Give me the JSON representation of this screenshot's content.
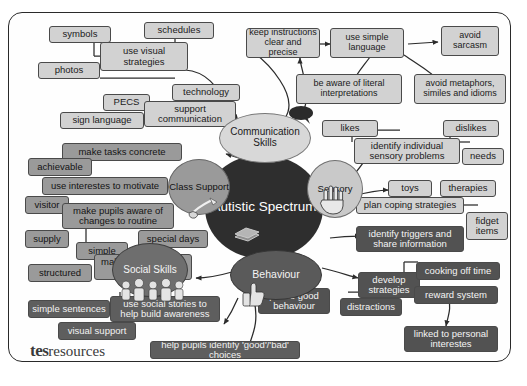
{
  "diagram": {
    "title": "Autistic Spectrum",
    "footer_logo_bold": "tes",
    "footer_logo_light": "resources",
    "colors": {
      "hub": "#2e2e2e",
      "branch_communication": "#d8d8d8",
      "branch_class_support": "#9a9a9a",
      "branch_sensory": "#c9c9c9",
      "branch_social": "#6e6e6e",
      "branch_behaviour": "#5a5a5a",
      "border": "#2a2a2a",
      "page_background": "#ffffff"
    }
  },
  "hub": {
    "label": "Autistic Spectrum",
    "icon": "books-icon"
  },
  "branches": [
    {
      "id": "communication",
      "label": "Communication Skills",
      "icon": "speech-bubble-icon"
    },
    {
      "id": "class_support",
      "label": "Class Support",
      "icon": "pencil-hand-icon"
    },
    {
      "id": "sensory",
      "label": "Sensory",
      "icon": "hand-icon"
    },
    {
      "id": "social",
      "label": "Social Skills",
      "icon": "children-group-icon"
    },
    {
      "id": "behaviour",
      "label": "Behaviour",
      "icon": "thumbs-up-icon"
    }
  ],
  "nodes": {
    "use_visual_strategies": "use visual strategies",
    "symbols": "symbols",
    "schedules": "schedules",
    "photos": "photos",
    "support_communication": "support communication",
    "pecs": "PECS",
    "technology": "technology",
    "sign_language": "sign language",
    "keep_instructions": "keep instructions clear and precise",
    "use_simple_language": "use simple language",
    "avoid_sarcasm": "avoid sarcasm",
    "be_aware_literal": "be aware of literal interpretations",
    "avoid_metaphors": "avoid metaphors, similes and idioms",
    "identify_sensory_problems": "identify individual sensory problems",
    "likes": "likes",
    "dislikes": "dislikes",
    "needs": "needs",
    "plan_coping_strategies": "plan coping strategies",
    "toys": "toys",
    "therapies": "therapies",
    "fidget_items": "fidget items",
    "make_tasks_concrete": "make tasks concrete",
    "achievable": "achievable",
    "use_interests_motivate": "use interestes to motivate",
    "make_pupils_aware": "make pupils aware of changes to routine",
    "visitor": "visitor",
    "supply": "supply",
    "special_days": "special days",
    "make_sure_rules": "make sure rules are understood",
    "simple": "simple",
    "structured": "structured",
    "use_social_stories": "use social stories to help build awareness",
    "simple_sentences": "simple sentences",
    "visual_support": "visual support",
    "help_pupils_identify": "help pupils identify 'good'/'bad' choices",
    "praise_good_behaviour": "praise good behaviour",
    "identify_triggers": "identify triggers and share information",
    "develop_strategies": "develop strategies",
    "distractions": "distractions",
    "cooling_off_time": "cooking off time",
    "reward_system": "reward system",
    "linked_personal_interests": "linked to personal interestes"
  }
}
